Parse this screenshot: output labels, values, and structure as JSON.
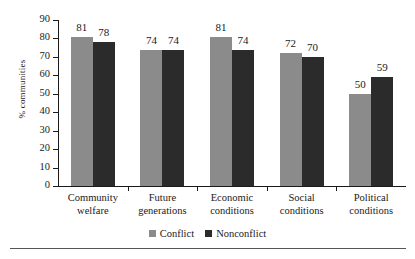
{
  "chart_data": {
    "type": "bar",
    "title": "",
    "xlabel": "",
    "ylabel": "% communities",
    "ylim": [
      0,
      90
    ],
    "yticks": [
      0,
      10,
      20,
      30,
      40,
      50,
      60,
      70,
      80,
      90
    ],
    "grid": false,
    "legend_position": "bottom-center",
    "categories": [
      "Community welfare",
      "Future generations",
      "Economic conditions",
      "Social conditions",
      "Political conditions"
    ],
    "category_lines": [
      [
        "Community",
        "welfare"
      ],
      [
        "Future",
        "generations"
      ],
      [
        "Economic",
        "conditions"
      ],
      [
        "Social",
        "conditions"
      ],
      [
        "Political",
        "conditions"
      ]
    ],
    "series": [
      {
        "name": "Conflict",
        "color": "#8b8b8b",
        "values": [
          81,
          74,
          81,
          72,
          50
        ]
      },
      {
        "name": "Nonconflict",
        "color": "#2b2b2b",
        "values": [
          78,
          74,
          74,
          70,
          59
        ]
      }
    ]
  }
}
